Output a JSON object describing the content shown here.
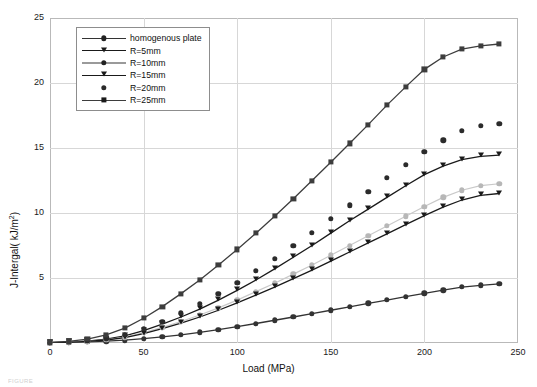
{
  "chart_data": {
    "type": "line",
    "title": "",
    "xlabel": "Load (MPa)",
    "ylabel": "J-Intergal( kJ/m2)",
    "ylabel_display": "J-Intergal( kJ/m²)",
    "xlim": [
      0,
      250
    ],
    "ylim": [
      0,
      25
    ],
    "xticks": [
      0,
      50,
      100,
      150,
      200,
      250
    ],
    "yticks": [
      0,
      5,
      10,
      15,
      20,
      25
    ],
    "ytick_labels": [
      "",
      "5",
      "10",
      "15",
      "20",
      "25"
    ],
    "grid": true,
    "legend_position": "upper-left-inside",
    "x": [
      0,
      10,
      20,
      30,
      40,
      50,
      60,
      70,
      80,
      90,
      100,
      110,
      120,
      130,
      140,
      150,
      160,
      170,
      180,
      190,
      200,
      210,
      220,
      230,
      240
    ],
    "series": [
      {
        "name": "homogenous plate",
        "marker": "circle",
        "color": "#333333",
        "values": [
          0.02,
          0.04,
          0.08,
          0.14,
          0.22,
          0.33,
          0.47,
          0.63,
          0.82,
          1.03,
          1.26,
          1.5,
          1.75,
          2.0,
          2.26,
          2.52,
          2.78,
          3.04,
          3.3,
          3.56,
          3.81,
          4.06,
          4.3,
          4.44,
          4.55
        ]
      },
      {
        "name": "R=5mm",
        "marker": "triangle-down",
        "color": "#1a1a1a",
        "values": [
          0.03,
          0.07,
          0.15,
          0.3,
          0.55,
          0.95,
          1.45,
          2.0,
          2.6,
          3.3,
          4.05,
          4.85,
          5.7,
          6.6,
          7.5,
          8.45,
          9.4,
          10.3,
          11.2,
          12.1,
          12.95,
          13.6,
          14.1,
          14.35,
          14.45
        ]
      },
      {
        "name": "R=10mm",
        "marker": "circle",
        "color": "#b7b7b7",
        "values": [
          0.02,
          0.06,
          0.13,
          0.25,
          0.45,
          0.8,
          1.2,
          1.65,
          2.15,
          2.7,
          3.3,
          3.95,
          4.6,
          5.3,
          6.0,
          6.75,
          7.5,
          8.25,
          9.0,
          9.75,
          10.5,
          11.2,
          11.75,
          12.1,
          12.25
        ]
      },
      {
        "name": "R=15mm",
        "marker": "triangle-down",
        "color": "#1a1a1a",
        "values": [
          0.02,
          0.05,
          0.12,
          0.23,
          0.42,
          0.72,
          1.1,
          1.52,
          2.0,
          2.52,
          3.08,
          3.68,
          4.3,
          4.95,
          5.6,
          6.3,
          7.0,
          7.7,
          8.4,
          9.1,
          9.8,
          10.45,
          11.0,
          11.35,
          11.5
        ]
      },
      {
        "name": "R=20mm",
        "marker": "circle",
        "color": "#2b2b2b",
        "values": [
          0.03,
          0.08,
          0.18,
          0.35,
          0.65,
          1.1,
          1.65,
          2.3,
          3.0,
          3.8,
          4.65,
          5.55,
          6.5,
          7.5,
          8.5,
          9.55,
          10.6,
          11.65,
          12.7,
          13.7,
          14.7,
          15.6,
          16.3,
          16.7,
          16.85
        ]
      },
      {
        "name": "R=25mm",
        "marker": "square",
        "color": "#3d3d3d",
        "values": [
          0.05,
          0.12,
          0.3,
          0.62,
          1.15,
          1.9,
          2.8,
          3.8,
          4.85,
          6.0,
          7.2,
          8.45,
          9.75,
          11.1,
          12.5,
          13.9,
          15.35,
          16.8,
          18.3,
          19.7,
          21.05,
          22.0,
          22.6,
          22.85,
          23.0
        ]
      }
    ]
  },
  "legend": {
    "items": [
      {
        "label": "homogenous plate",
        "marker": "circle",
        "line": true,
        "color": "#333333"
      },
      {
        "label": "R=5mm",
        "marker": "triangle-down",
        "line": true,
        "color": "#1a1a1a"
      },
      {
        "label": "R=10mm",
        "marker": "circle",
        "line": true,
        "color": "#9a9a9a"
      },
      {
        "label": "R=15mm",
        "marker": "triangle-down",
        "line": true,
        "color": "#1a1a1a"
      },
      {
        "label": "R=20mm",
        "marker": "circle",
        "line": false,
        "color": "#2b2b2b"
      },
      {
        "label": "R=25mm",
        "marker": "square",
        "line": true,
        "color": "#3d3d3d"
      }
    ]
  },
  "caption": {
    "text": "FIGURE"
  }
}
